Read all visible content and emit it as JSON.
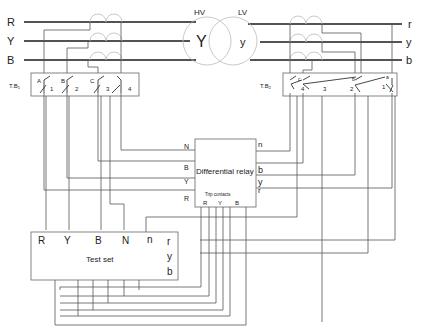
{
  "phases_hv": [
    "R",
    "Y",
    "B"
  ],
  "phases_lv": [
    "r",
    "y",
    "b"
  ],
  "transformer": {
    "hv_label": "HV",
    "lv_label": "LV",
    "hv_winding": "Y",
    "lv_winding": "y"
  },
  "terminal_block_1": {
    "label": "T.B",
    "subscript": "1",
    "switch_letters": [
      "A",
      "B",
      "C"
    ],
    "switch_numbers": [
      "1",
      "2",
      "3",
      "4"
    ]
  },
  "terminal_block_2": {
    "label": "T.B",
    "subscript": "2",
    "switch_letters": [
      "a",
      "b",
      "c"
    ],
    "switch_numbers": [
      "4",
      "3",
      "2",
      "1"
    ]
  },
  "relay": {
    "title": "Differential relay",
    "left_terminals": [
      "N",
      "B",
      "Y",
      "R"
    ],
    "right_terminals": [
      "n",
      "b",
      "y",
      "r"
    ],
    "trip_label": "Trip contacts",
    "trip_terminals": [
      "R",
      "Y",
      "B"
    ]
  },
  "test_set": {
    "title": "Test set",
    "top_terminals": [
      "R",
      "Y",
      "B",
      "N",
      "n"
    ],
    "right_terminals": [
      "r",
      "y",
      "b"
    ]
  }
}
